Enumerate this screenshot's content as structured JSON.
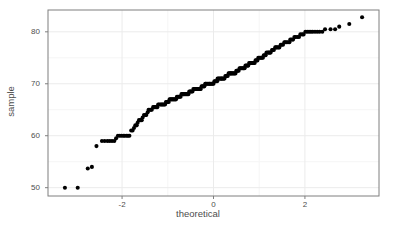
{
  "chart_data": {
    "type": "scatter",
    "title": "",
    "subtitle": "",
    "xlabel": "theoretical",
    "ylabel": "sample",
    "xlim": [
      -3.62,
      3.62
    ],
    "ylim": [
      48.4,
      84.2
    ],
    "xticks": [
      -2,
      0,
      2
    ],
    "xtick_labels": [
      "-2",
      "0",
      "2"
    ],
    "yticks": [
      50,
      60,
      70,
      80
    ],
    "ytick_labels": [
      "50",
      "60",
      "70",
      "80"
    ],
    "grid": true,
    "grid_major_color": "#ebebeb",
    "grid_minor_color": "#f5f5f5",
    "panel_background": "#ffffff",
    "panel_border_color": "#7f7f7f",
    "point_color": "#000000",
    "point_size": 3.1,
    "legend": null,
    "legend_position": "none",
    "annotations": [],
    "series": [
      {
        "name": "sample quantiles",
        "x": [
          -3.25,
          -2.97,
          -2.75,
          -2.66,
          -2.56,
          -2.44,
          -2.38,
          -2.32,
          -2.27,
          -2.22,
          -2.17,
          -2.13,
          -2.09,
          -2.05,
          -2.01,
          -1.97,
          -1.94,
          -1.9,
          -1.87,
          -1.84,
          -1.8,
          -1.77,
          -1.74,
          -1.71,
          -1.68,
          -1.66,
          -1.63,
          -1.6,
          -1.57,
          -1.55,
          -1.52,
          -1.49,
          -1.47,
          -1.44,
          -1.42,
          -1.39,
          -1.37,
          -1.35,
          -1.32,
          -1.3,
          -1.28,
          -1.25,
          -1.23,
          -1.21,
          -1.19,
          -1.16,
          -1.14,
          -1.12,
          -1.1,
          -1.08,
          -1.06,
          -1.04,
          -1.02,
          -1.0,
          -0.98,
          -0.96,
          -0.94,
          -0.92,
          -0.9,
          -0.88,
          -0.86,
          -0.84,
          -0.82,
          -0.8,
          -0.78,
          -0.76,
          -0.74,
          -0.72,
          -0.7,
          -0.68,
          -0.66,
          -0.65,
          -0.63,
          -0.61,
          -0.59,
          -0.57,
          -0.55,
          -0.53,
          -0.51,
          -0.5,
          -0.48,
          -0.46,
          -0.44,
          -0.42,
          -0.4,
          -0.38,
          -0.37,
          -0.35,
          -0.33,
          -0.31,
          -0.29,
          -0.28,
          -0.26,
          -0.24,
          -0.22,
          -0.2,
          -0.18,
          -0.17,
          -0.15,
          -0.13,
          -0.11,
          -0.09,
          -0.08,
          -0.06,
          -0.04,
          -0.02,
          0.0,
          0.02,
          0.04,
          0.06,
          0.08,
          0.09,
          0.11,
          0.13,
          0.15,
          0.17,
          0.18,
          0.2,
          0.22,
          0.24,
          0.26,
          0.28,
          0.29,
          0.31,
          0.33,
          0.35,
          0.37,
          0.38,
          0.4,
          0.42,
          0.44,
          0.46,
          0.48,
          0.5,
          0.51,
          0.53,
          0.55,
          0.57,
          0.59,
          0.61,
          0.63,
          0.65,
          0.66,
          0.68,
          0.7,
          0.72,
          0.74,
          0.76,
          0.78,
          0.8,
          0.82,
          0.84,
          0.86,
          0.88,
          0.9,
          0.92,
          0.94,
          0.96,
          0.98,
          1.0,
          1.02,
          1.04,
          1.06,
          1.08,
          1.1,
          1.12,
          1.14,
          1.16,
          1.19,
          1.21,
          1.23,
          1.25,
          1.28,
          1.3,
          1.32,
          1.35,
          1.37,
          1.39,
          1.42,
          1.44,
          1.47,
          1.49,
          1.52,
          1.55,
          1.57,
          1.6,
          1.63,
          1.66,
          1.68,
          1.71,
          1.74,
          1.77,
          1.8,
          1.84,
          1.87,
          1.9,
          1.94,
          1.97,
          2.01,
          2.05,
          2.09,
          2.13,
          2.17,
          2.22,
          2.27,
          2.32,
          2.38,
          2.44,
          2.56,
          2.66,
          2.75,
          2.97,
          3.25
        ],
        "y": [
          50,
          50,
          53.7,
          54,
          58,
          59,
          59,
          59,
          59,
          59,
          59,
          59.5,
          60,
          60,
          60,
          60,
          60,
          60,
          60,
          60,
          61,
          61,
          61.5,
          62,
          62,
          62.5,
          63,
          63,
          63,
          63.5,
          64,
          64,
          64,
          64.5,
          65,
          65,
          65,
          65,
          65.5,
          65.5,
          65.5,
          65.5,
          65.5,
          66,
          66,
          66,
          66,
          66,
          66,
          66,
          66,
          66.5,
          66.5,
          66.5,
          66.5,
          67,
          67,
          67,
          67,
          67,
          67,
          67,
          67,
          67.5,
          67.5,
          67.5,
          67.5,
          67.5,
          68,
          68,
          68,
          68,
          68,
          68,
          68,
          68,
          68,
          68.5,
          68.5,
          68.5,
          68.5,
          68.5,
          69,
          69,
          69,
          69,
          69,
          69,
          69,
          69,
          69,
          69,
          69.5,
          69.5,
          69.5,
          69.5,
          70,
          70,
          70,
          70,
          70,
          70,
          70,
          70,
          70,
          70,
          70,
          70.5,
          70.5,
          70.5,
          70.5,
          71,
          71,
          71,
          71,
          71,
          71,
          71,
          71,
          71,
          71.5,
          71.5,
          71.5,
          71.5,
          72,
          72,
          72,
          72,
          72,
          72,
          72,
          72,
          72,
          72.5,
          72.5,
          72.5,
          72.5,
          73,
          73,
          73,
          73,
          73,
          73,
          73,
          73.5,
          73.5,
          73.5,
          73.5,
          74,
          74,
          74,
          74,
          74,
          74,
          74,
          74.5,
          74.5,
          74.5,
          75,
          75,
          75,
          75,
          75,
          75,
          75.5,
          75.5,
          75.5,
          76,
          76,
          76,
          76,
          76,
          76.5,
          76.5,
          76.5,
          77,
          77,
          77,
          77,
          77,
          77.5,
          77.5,
          77.5,
          78,
          78,
          78,
          78,
          78,
          78.5,
          78.5,
          78.5,
          79,
          79,
          79,
          79,
          79.5,
          79.5,
          79.5,
          80,
          80,
          80,
          80,
          80,
          80,
          80,
          80,
          80,
          80.5,
          80.5,
          80.5,
          81,
          81.5,
          82.8
        ]
      }
    ]
  },
  "axes": {
    "x_title": "theoretical",
    "y_title": "sample"
  },
  "panel": {
    "left": 48,
    "top": 10,
    "right": 379,
    "bottom": 196
  }
}
